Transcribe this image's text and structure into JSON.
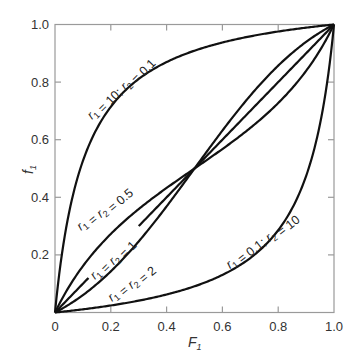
{
  "chart_data": {
    "type": "line",
    "title": "",
    "xlabel": "F1",
    "ylabel": "f1",
    "xlim": [
      0,
      1.0
    ],
    "ylim": [
      0,
      1.0
    ],
    "grid": false,
    "legend": "none (inline curve labels)",
    "x_ticks": [
      "0",
      "0.2",
      "0.4",
      "0.6",
      "0.8",
      "1.0"
    ],
    "y_ticks": [
      "0.2",
      "0.4",
      "0.6",
      "0.8",
      "1.0"
    ],
    "curve_formula": "y = (r1*x^2 + x*(1-x)) / (r1*x^2 + 2*x*(1-x) + r2*(1-x)^2)",
    "series": [
      {
        "name": "r1 = 10; r2 = 0.1",
        "r1": 10,
        "r2": 0.1,
        "x": [
          0,
          0.1,
          0.2,
          0.3,
          0.4,
          0.5,
          0.6,
          0.7,
          0.8,
          0.9,
          1.0
        ],
        "values": [
          0,
          0.555,
          0.714,
          0.792,
          0.841,
          0.873,
          0.896,
          0.915,
          0.933,
          0.952,
          1.0
        ]
      },
      {
        "name": "r1 = r2 = 0.5",
        "r1": 0.5,
        "r2": 0.5,
        "x": [
          0,
          0.1,
          0.2,
          0.3,
          0.4,
          0.5,
          0.6,
          0.7,
          0.8,
          0.9,
          1.0
        ],
        "values": [
          0,
          0.155,
          0.273,
          0.37,
          0.44,
          0.5,
          0.56,
          0.63,
          0.727,
          0.845,
          1.0
        ]
      },
      {
        "name": "r1 = r2 = 1",
        "r1": 1,
        "r2": 1,
        "x": [
          0,
          0.1,
          0.2,
          0.3,
          0.4,
          0.5,
          0.6,
          0.7,
          0.8,
          0.9,
          1.0
        ],
        "values": [
          0,
          0.1,
          0.2,
          0.3,
          0.4,
          0.5,
          0.6,
          0.7,
          0.8,
          0.9,
          1.0
        ]
      },
      {
        "name": "r1 = r2 = 2",
        "r1": 2,
        "r2": 2,
        "x": [
          0,
          0.1,
          0.2,
          0.3,
          0.4,
          0.5,
          0.6,
          0.7,
          0.8,
          0.9,
          1.0
        ],
        "values": [
          0,
          0.055,
          0.133,
          0.236,
          0.36,
          0.5,
          0.64,
          0.764,
          0.867,
          0.945,
          1.0
        ]
      },
      {
        "name": "r1 = 0.1; r2 = 10",
        "r1": 0.1,
        "r2": 10,
        "x": [
          0,
          0.1,
          0.2,
          0.3,
          0.4,
          0.5,
          0.6,
          0.7,
          0.8,
          0.9,
          1.0
        ],
        "values": [
          0,
          0.048,
          0.067,
          0.085,
          0.104,
          0.127,
          0.159,
          0.208,
          0.286,
          0.445,
          1.0
        ]
      }
    ],
    "annotations": [
      {
        "text": "r1 = 10; r2 = 0.1",
        "parts": [
          [
            "r",
            "1"
          ],
          [
            " = 10; ",
            null
          ],
          [
            "r",
            "2"
          ],
          [
            " = 0.1",
            null
          ]
        ]
      },
      {
        "text": "r1 = r2 = 0.5",
        "parts": [
          [
            "r",
            "1"
          ],
          [
            " = ",
            null
          ],
          [
            "r",
            "2"
          ],
          [
            " = 0.5",
            null
          ]
        ]
      },
      {
        "text": "r1 = r2 = 1",
        "parts": [
          [
            "r",
            "1"
          ],
          [
            " = ",
            null
          ],
          [
            "r",
            "2"
          ],
          [
            " = 1",
            null
          ]
        ]
      },
      {
        "text": "r1 = r2 = 2",
        "parts": [
          [
            "r",
            "1"
          ],
          [
            " = ",
            null
          ],
          [
            "r",
            "2"
          ],
          [
            " = 2",
            null
          ]
        ]
      },
      {
        "text": "r1 = 0.1; r2 = 10",
        "parts": [
          [
            "r",
            "1"
          ],
          [
            " = 0.1; ",
            null
          ],
          [
            "r",
            "2"
          ],
          [
            " = 10",
            null
          ]
        ]
      }
    ]
  },
  "axes": {
    "x_label_main": "F",
    "x_label_sub": "1",
    "y_label_main": "f",
    "y_label_sub": "1",
    "origin_label": "0"
  },
  "colors": {
    "curve": "#111111",
    "frame": "#9a9a9a",
    "text": "#333333"
  }
}
